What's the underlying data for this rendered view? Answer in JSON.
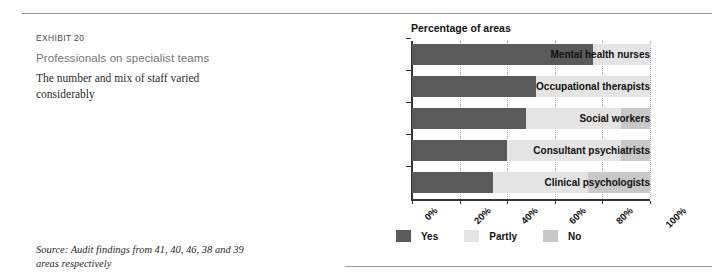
{
  "exhibit": {
    "label": "EXHIBIT 20",
    "title": "Professionals on specialist teams",
    "subtitle": "The number and mix of staff varied considerably",
    "source": "Source: Audit findings from 41, 40, 46, 38 and 39 areas respectively"
  },
  "legend": {
    "items": [
      {
        "label": "Yes",
        "color": "#5a5a5a"
      },
      {
        "label": "Partly",
        "color": "#e4e4e4"
      },
      {
        "label": "No",
        "color": "#c8c8c8"
      }
    ]
  },
  "chart_data": {
    "type": "bar",
    "orientation": "horizontal",
    "stacked": true,
    "title": "Percentage of areas",
    "xlabel": "",
    "ylabel": "",
    "xlim": [
      0,
      100
    ],
    "grid": true,
    "legend_position": "bottom",
    "tick_labels": [
      "0%",
      "20%",
      "40%",
      "60%",
      "80%",
      "100%"
    ],
    "tick_values": [
      0,
      20,
      40,
      60,
      80,
      100
    ],
    "categories": [
      "Mental health nurses",
      "Occupational therapists",
      "Social workers",
      "Consultant psychiatrists",
      "Clinical psychologists"
    ],
    "series": [
      {
        "name": "Yes",
        "color": "#5a5a5a",
        "values": [
          76,
          52,
          48,
          40,
          34
        ]
      },
      {
        "name": "Partly",
        "color": "#e4e4e4",
        "values": [
          24,
          48,
          40,
          48,
          40
        ]
      },
      {
        "name": "No",
        "color": "#c8c8c8",
        "values": [
          0,
          0,
          12,
          12,
          26
        ]
      }
    ]
  }
}
